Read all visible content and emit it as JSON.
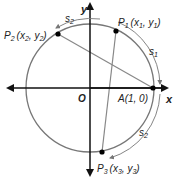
{
  "diagram": {
    "axes": {
      "x_label": "x",
      "y_label": "y",
      "origin_label": "O"
    },
    "points": {
      "A": {
        "label": "A(1, 0)"
      },
      "P1": {
        "label": "P",
        "sub": "1",
        "coords": "(x",
        "csub": "1",
        "c2": ", y",
        "c2sub": "1",
        "close": ")"
      },
      "P2": {
        "label": "P",
        "sub": "2",
        "coords": "(x",
        "csub": "2",
        "c2": ", y",
        "c2sub": "2",
        "close": ")"
      },
      "P3": {
        "label": "P",
        "sub": "3",
        "coords": "(x",
        "csub": "3",
        "c2": ", y",
        "c2sub": "3",
        "close": ")"
      }
    },
    "arcs": {
      "s1": {
        "label": "s",
        "sub": "1"
      },
      "s2_top": {
        "label": "s",
        "sub": "2"
      },
      "s2_bottom": {
        "label": "s",
        "sub": "2"
      }
    },
    "colors": {
      "circle": "#777777",
      "chords": "#888888",
      "axes": "#111111",
      "points": "#000000"
    }
  }
}
